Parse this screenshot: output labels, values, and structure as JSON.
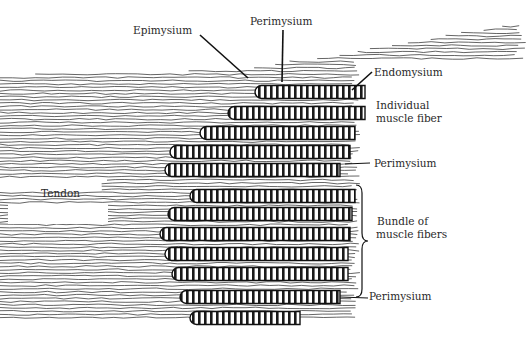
{
  "figure": {
    "type": "anatomical-illustration",
    "ink_color": "#1a1a1a",
    "background": "#ffffff"
  },
  "labels": {
    "epimysium": "Epimysium",
    "perimysium_top": "Perimysium",
    "endomysium": "Endomysium",
    "individual_fiber_line1": "Individual",
    "individual_fiber_line2": "muscle fiber",
    "perimysium_mid": "Perimysium",
    "bundle_line1": "Bundle of",
    "bundle_line2": "muscle fibers",
    "perimysium_bottom": "Perimysium",
    "tendon": "Tendon"
  },
  "fibers": {
    "upper_bundle": [
      {
        "x1": 255,
        "y": 92,
        "x2": 365
      },
      {
        "x1": 228,
        "y": 113,
        "x2": 365
      },
      {
        "x1": 200,
        "y": 133,
        "x2": 355
      },
      {
        "x1": 170,
        "y": 152,
        "x2": 350
      },
      {
        "x1": 165,
        "y": 170,
        "x2": 340
      }
    ],
    "lower_bundle": [
      {
        "x1": 190,
        "y": 196,
        "x2": 355
      },
      {
        "x1": 168,
        "y": 214,
        "x2": 352
      },
      {
        "x1": 160,
        "y": 234,
        "x2": 350
      },
      {
        "x1": 165,
        "y": 254,
        "x2": 348
      },
      {
        "x1": 172,
        "y": 274,
        "x2": 348
      },
      {
        "x1": 180,
        "y": 297,
        "x2": 340
      },
      {
        "x1": 190,
        "y": 318,
        "x2": 300
      }
    ]
  }
}
